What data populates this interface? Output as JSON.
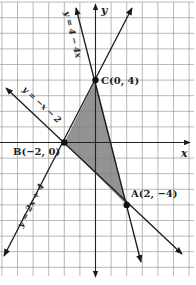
{
  "figure": {
    "type": "coordinate-plane-diagram",
    "axes": {
      "x_label": "x",
      "y_label": "y"
    },
    "grid": {
      "unit_px": 15.6,
      "origin_px": [
        95.5,
        142.5
      ],
      "x_range": [
        -6,
        6
      ],
      "y_range": [
        -8,
        9
      ]
    },
    "colors": {
      "shade": "#808080",
      "grid": "#9a9a9a",
      "ink": "#1a1a1a"
    },
    "lines": [
      {
        "equation": "y = 4 − 4x",
        "label": "y = 4 − 4x"
      },
      {
        "equation": "y = −x − 2",
        "label": "y = −x − 2"
      },
      {
        "equation": "y = 2x + 4",
        "label": "y = 2x + 4"
      }
    ],
    "points": [
      {
        "name": "C",
        "coords": [
          0,
          4
        ],
        "label": "C(0, 4)"
      },
      {
        "name": "B",
        "coords": [
          -2,
          0
        ],
        "label": "B(−2, 0)"
      },
      {
        "name": "A",
        "coords": [
          2,
          -4
        ],
        "label": "A(2, −4)"
      }
    ],
    "shaded_region": "triangle ABC"
  }
}
